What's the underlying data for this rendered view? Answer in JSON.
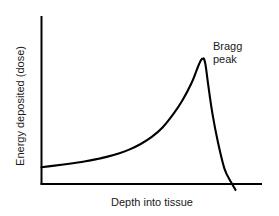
{
  "chart_data": {
    "type": "line",
    "title": "",
    "subtitle": "",
    "xlabel": "Depth into tissue",
    "ylabel": "Energy deposited (dose)",
    "grid": false,
    "legend": "none",
    "xticks": [],
    "yticks": [],
    "xlim": [
      0,
      1
    ],
    "ylim": [
      0,
      1
    ],
    "annotations": [
      {
        "name": "bragg-peak",
        "line1": "Bragg",
        "line2": "peak",
        "points_to_x": 0.735,
        "points_to_y": 0.745
      }
    ],
    "series": [
      {
        "name": "Proton depth-dose curve",
        "color": "#000000",
        "x": [
          0.0,
          0.05,
          0.1,
          0.15,
          0.2,
          0.25,
          0.3,
          0.35,
          0.4,
          0.45,
          0.5,
          0.55,
          0.6,
          0.64,
          0.68,
          0.7,
          0.715,
          0.725,
          0.733,
          0.738,
          0.745,
          0.755,
          0.775,
          0.8,
          0.83,
          0.86,
          0.88
        ],
        "y": [
          0.1,
          0.108,
          0.116,
          0.125,
          0.135,
          0.148,
          0.163,
          0.182,
          0.206,
          0.238,
          0.28,
          0.338,
          0.42,
          0.5,
          0.6,
          0.665,
          0.715,
          0.74,
          0.748,
          0.742,
          0.7,
          0.6,
          0.42,
          0.25,
          0.09,
          0.01,
          -0.035
        ]
      }
    ]
  },
  "axes": {
    "y_axis_name": "y-axis-line",
    "x_axis_name": "x-axis-line"
  }
}
